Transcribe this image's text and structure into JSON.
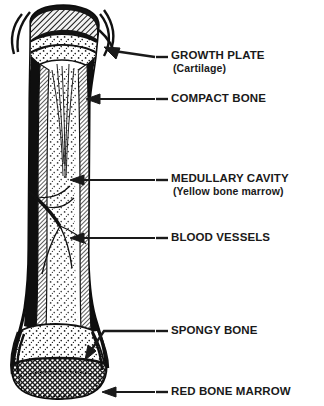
{
  "diagram": {
    "colors": {
      "ink": "#1a1a1a",
      "background": "#ffffff",
      "compact_bone": "#111111",
      "hatch": "#333333"
    },
    "structures": [
      {
        "id": "proximal-epiphysis",
        "name": "proximal epiphysis"
      },
      {
        "id": "growth-plate-band",
        "name": "growth plate band"
      },
      {
        "id": "compact-bone-wall",
        "name": "compact bone wall"
      },
      {
        "id": "medullary-cavity-region",
        "name": "medullary cavity"
      },
      {
        "id": "blood-vessel-lines",
        "name": "blood vessels"
      },
      {
        "id": "spongy-bone-region",
        "name": "spongy bone"
      },
      {
        "id": "red-marrow-region",
        "name": "red bone marrow"
      },
      {
        "id": "distal-epiphysis",
        "name": "distal epiphysis"
      }
    ]
  },
  "labels": [
    {
      "id": "growth-plate",
      "main": "GROWTH PLATE",
      "sub": "(Cartilage)",
      "leader": "arrow-up-left"
    },
    {
      "id": "compact-bone",
      "main": "COMPACT BONE",
      "sub": "",
      "leader": "arrow-left"
    },
    {
      "id": "medullary-cavity",
      "main": "MEDULLARY CAVITY",
      "sub": "(Yellow bone marrow)",
      "leader": "arrow-left"
    },
    {
      "id": "blood-vessels",
      "main": "BLOOD VESSELS",
      "sub": "",
      "leader": "arrow-left"
    },
    {
      "id": "spongy-bone",
      "main": "SPONGY BONE",
      "sub": "",
      "leader": "elbow-down-left"
    },
    {
      "id": "red-bone-marrow",
      "main": "RED BONE MARROW",
      "sub": "",
      "leader": "arrow-left"
    }
  ]
}
